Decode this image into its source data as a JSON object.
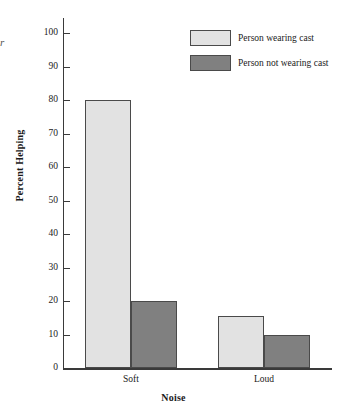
{
  "chart_data": {
    "type": "bar",
    "title": "",
    "xlabel": "Noise",
    "ylabel": "Percent Helping",
    "categories": [
      "Soft",
      "Loud"
    ],
    "series": [
      {
        "name": "Person wearing cast",
        "values": [
          80,
          15.5
        ],
        "color": "#e2e2e2"
      },
      {
        "name": "Person not wearing cast",
        "values": [
          20,
          10
        ],
        "color": "#808080"
      }
    ],
    "ylim": [
      0,
      100
    ],
    "yticks": [
      0,
      10,
      20,
      30,
      40,
      50,
      60,
      70,
      80,
      90,
      100
    ],
    "ytick_labels": [
      "0",
      "10",
      "20",
      "30",
      "40",
      "50",
      "60",
      "70",
      "80",
      "90",
      "100"
    ],
    "grid": false,
    "legend_position": "top-right",
    "stray_glyph": "r"
  },
  "legend": {
    "items": [
      {
        "label": "Person wearing cast",
        "color": "#e2e2e2"
      },
      {
        "label": "Person not wearing cast",
        "color": "#808080"
      }
    ]
  },
  "axes": {
    "y_title": "Percent Helping",
    "x_title": "Noise"
  }
}
